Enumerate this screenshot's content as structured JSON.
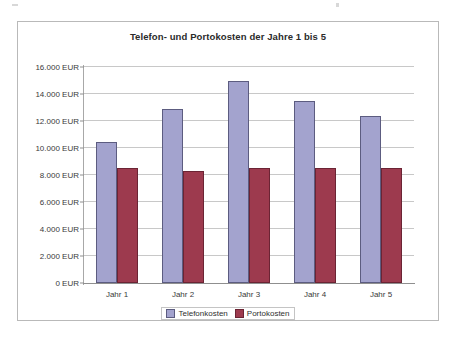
{
  "chart_data": {
    "type": "bar",
    "title": "Telefon- und Portokosten der Jahre 1 bis 5",
    "xlabel": "",
    "ylabel": "",
    "categories": [
      "Jahr 1",
      "Jahr 2",
      "Jahr 3",
      "Jahr 4",
      "Jahr 5"
    ],
    "series": [
      {
        "name": "Telefonkosten",
        "color": "#a3a3ce",
        "values": [
          10450,
          12900,
          15000,
          13450,
          12400
        ]
      },
      {
        "name": "Portokosten",
        "color": "#9d3a4e",
        "values": [
          8500,
          8300,
          8550,
          8550,
          8500
        ]
      }
    ],
    "ylim": [
      0,
      16000
    ],
    "ytick_values": [
      0,
      2000,
      4000,
      6000,
      8000,
      10000,
      12000,
      14000,
      16000
    ],
    "ytick_labels": [
      "0 EUR",
      "2.000 EUR",
      "4.000 EUR",
      "6.000 EUR",
      "8.000 EUR",
      "10.000 EUR",
      "12.000 EUR",
      "14.000 EUR",
      "16.000 EUR"
    ],
    "grid": true,
    "legend_position": "bottom",
    "unit": "EUR"
  }
}
